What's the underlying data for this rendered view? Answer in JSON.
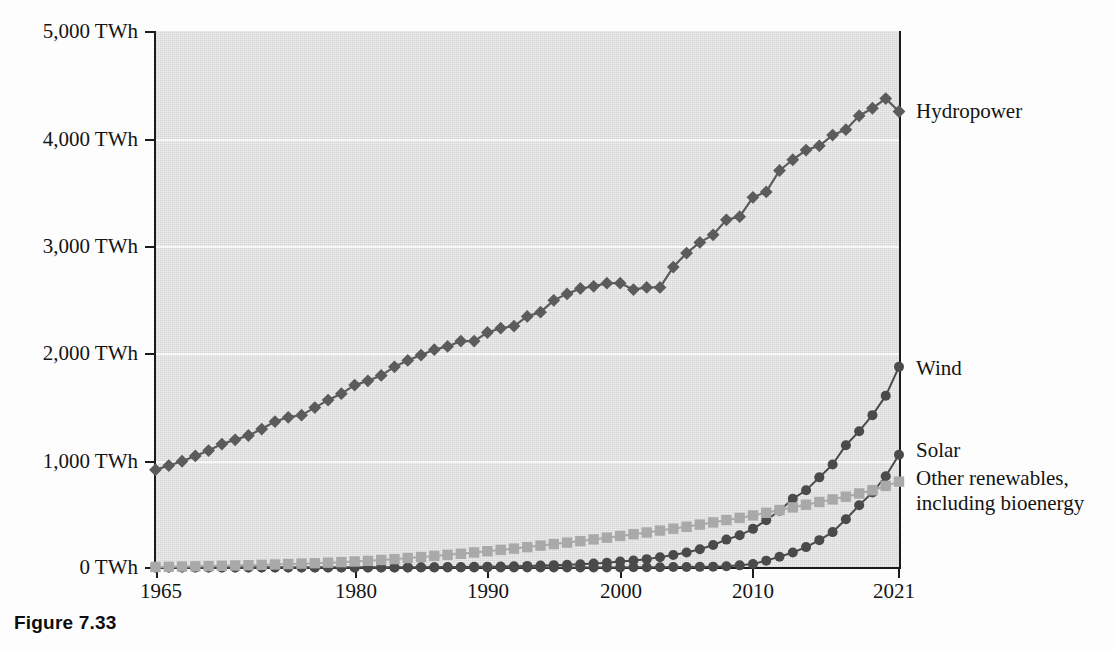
{
  "caption": "Figure 7.33",
  "chart_data": {
    "type": "line",
    "title": "",
    "subtitle": "",
    "xlabel": "",
    "ylabel": "",
    "xlim": [
      1965,
      2021
    ],
    "ylim": [
      0,
      5000
    ],
    "grid": true,
    "legend_position": "right-of-plot-end-labels",
    "y_tick_labels": [
      "5,000 TWh",
      "4,000 TWh",
      "3,000 TWh",
      "2,000 TWh",
      "1,000 TWh",
      "0 TWh"
    ],
    "y_tick_values": [
      5000,
      4000,
      3000,
      2000,
      1000,
      0
    ],
    "x_tick_labels": [
      "1965",
      "1980",
      "1990",
      "2000",
      "2010",
      "2021"
    ],
    "x_tick_values": [
      1965,
      1980,
      1990,
      2000,
      2010,
      2021
    ],
    "unit": "TWh",
    "x": [
      1965,
      1966,
      1967,
      1968,
      1969,
      1970,
      1971,
      1972,
      1973,
      1974,
      1975,
      1976,
      1977,
      1978,
      1979,
      1980,
      1981,
      1982,
      1983,
      1984,
      1985,
      1986,
      1987,
      1988,
      1989,
      1990,
      1991,
      1992,
      1993,
      1994,
      1995,
      1996,
      1997,
      1998,
      1999,
      2000,
      2001,
      2002,
      2003,
      2004,
      2005,
      2006,
      2007,
      2008,
      2009,
      2010,
      2011,
      2012,
      2013,
      2014,
      2015,
      2016,
      2017,
      2018,
      2019,
      2020,
      2021
    ],
    "series": [
      {
        "name": "Hydropower",
        "label": "Hydropower",
        "marker": "diamond",
        "color": "#5b5b5b",
        "values": [
          910,
          950,
          990,
          1040,
          1090,
          1150,
          1190,
          1230,
          1290,
          1360,
          1400,
          1420,
          1490,
          1560,
          1620,
          1700,
          1740,
          1790,
          1870,
          1930,
          1980,
          2030,
          2060,
          2110,
          2110,
          2190,
          2230,
          2250,
          2340,
          2380,
          2490,
          2550,
          2600,
          2620,
          2650,
          2650,
          2590,
          2610,
          2610,
          2800,
          2930,
          3030,
          3100,
          3240,
          3270,
          3450,
          3500,
          3700,
          3800,
          3890,
          3930,
          4030,
          4080,
          4210,
          4280,
          4370,
          4250
        ]
      },
      {
        "name": "Wind",
        "label": "Wind",
        "marker": "circle",
        "color": "#4a4a4a",
        "values": [
          0,
          0,
          0,
          0,
          0,
          0,
          0,
          0,
          0,
          0,
          0,
          0,
          0,
          0,
          0,
          0,
          0,
          0,
          0,
          1,
          2,
          3,
          4,
          5,
          6,
          8,
          10,
          12,
          15,
          18,
          22,
          26,
          31,
          37,
          45,
          55,
          66,
          78,
          95,
          116,
          140,
          170,
          210,
          260,
          300,
          360,
          440,
          530,
          640,
          720,
          840,
          960,
          1140,
          1270,
          1420,
          1600,
          1870
        ]
      },
      {
        "name": "Solar",
        "label": "Solar",
        "marker": "circle",
        "color": "#4a4a4a",
        "values": [
          0,
          0,
          0,
          0,
          0,
          0,
          0,
          0,
          0,
          0,
          0,
          0,
          0,
          0,
          0,
          0,
          0,
          0,
          0,
          0,
          0,
          0,
          0,
          0,
          0,
          0,
          0,
          0,
          0,
          0,
          0,
          0,
          1,
          1,
          1,
          1,
          2,
          2,
          3,
          4,
          5,
          6,
          8,
          12,
          20,
          32,
          64,
          100,
          140,
          190,
          255,
          330,
          450,
          580,
          700,
          850,
          1050
        ]
      },
      {
        "name": "Other renewables, including bioenergy",
        "label": "Other renewables, including bioenergy",
        "marker": "square",
        "color": "#a9a9a9",
        "values": [
          5,
          7,
          9,
          11,
          13,
          16,
          19,
          22,
          25,
          28,
          32,
          36,
          40,
          45,
          50,
          56,
          62,
          70,
          78,
          88,
          98,
          108,
          118,
          128,
          140,
          152,
          164,
          176,
          190,
          204,
          218,
          232,
          246,
          262,
          278,
          294,
          310,
          326,
          344,
          362,
          380,
          400,
          420,
          442,
          462,
          485,
          510,
          535,
          560,
          585,
          610,
          635,
          660,
          690,
          720,
          760,
          800
        ]
      }
    ]
  }
}
